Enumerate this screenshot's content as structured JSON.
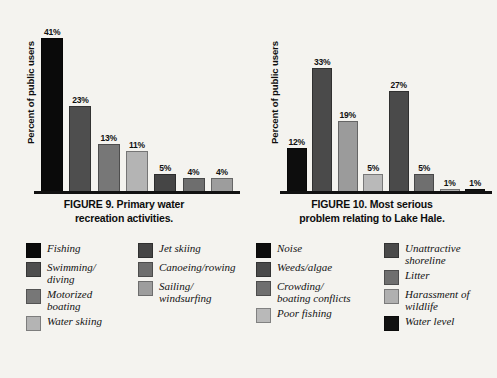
{
  "chart_data": [
    {
      "type": "bar",
      "title": "FIGURE 9.  Primary water recreation activities.",
      "title_line1": "FIGURE 9.  Primary water",
      "title_line2": "recreation activities.",
      "xlabel": "",
      "ylabel": "Percent of public users",
      "ylim": [
        0,
        45
      ],
      "grid": false,
      "legend_position": "below",
      "categories": [
        "Fishing",
        "Swimming/diving",
        "Motorized boating",
        "Water skiing",
        "Jet skiing",
        "Canoeing/rowing",
        "Sailing/windsurfing"
      ],
      "values": [
        41,
        23,
        13,
        11,
        5,
        4,
        4
      ],
      "value_labels": [
        "41%",
        "23%",
        "13%",
        "11%",
        "5%",
        "4%",
        "4%"
      ],
      "colors": [
        "#0a0a0a",
        "#4e4e4e",
        "#777777",
        "#b4b4b4",
        "#454545",
        "#6e6e6e",
        "#9d9d9d"
      ],
      "legend": [
        {
          "label_line1": "Fishing",
          "label_line2": "",
          "color": "#0a0a0a"
        },
        {
          "label_line1": "Swimming/",
          "label_line2": "diving",
          "color": "#4e4e4e"
        },
        {
          "label_line1": "Motorized",
          "label_line2": "boating",
          "color": "#777777"
        },
        {
          "label_line1": "Water skiing",
          "label_line2": "",
          "color": "#b4b4b4"
        },
        {
          "label_line1": "Jet skiing",
          "label_line2": "",
          "color": "#454545"
        },
        {
          "label_line1": "Canoeing/rowing",
          "label_line2": "",
          "color": "#6e6e6e"
        },
        {
          "label_line1": "Sailing/",
          "label_line2": "windsurfing",
          "color": "#9d9d9d"
        }
      ]
    },
    {
      "type": "bar",
      "title": "FIGURE 10.  Most serious problem relating to Lake Hale.",
      "title_line1": "FIGURE 10.  Most serious",
      "title_line2": "problem relating to Lake Hale.",
      "xlabel": "",
      "ylabel": "Percent of public users",
      "ylim": [
        0,
        45
      ],
      "grid": false,
      "legend_position": "below",
      "categories": [
        "Noise",
        "Weeds/algae",
        "Crowding/boating conflicts",
        "Poor fishing",
        "Unattractive shoreline",
        "Litter",
        "Harassment of wildlife",
        "Water level"
      ],
      "values": [
        12,
        33,
        19,
        5,
        27,
        5,
        1,
        1
      ],
      "value_labels": [
        "12%",
        "33%",
        "19%",
        "5%",
        "27%",
        "5%",
        "1%",
        "1%"
      ],
      "colors": [
        "#0d0d0d",
        "#4a4a4a",
        "#9b9b9b",
        "#b9b9b9",
        "#4a4a4a",
        "#6f6f6f",
        "#b0b0b0",
        "#111111"
      ],
      "legend": [
        {
          "label_line1": "Noise",
          "label_line2": "",
          "color": "#0d0d0d"
        },
        {
          "label_line1": "Weeds/algae",
          "label_line2": "",
          "color": "#4a4a4a"
        },
        {
          "label_line1": "Crowding/",
          "label_line2": "boating conflicts",
          "color": "#6f6f6f"
        },
        {
          "label_line1": "Poor fishing",
          "label_line2": "",
          "color": "#b9b9b9"
        },
        {
          "label_line1": "Unattractive",
          "label_line2": "shoreline",
          "color": "#4a4a4a"
        },
        {
          "label_line1": "Litter",
          "label_line2": "",
          "color": "#6f6f6f"
        },
        {
          "label_line1": "Harassment of",
          "label_line2": "wildlife",
          "color": "#b0b0b0"
        },
        {
          "label_line1": "Water level",
          "label_line2": "",
          "color": "#111111"
        }
      ]
    }
  ]
}
